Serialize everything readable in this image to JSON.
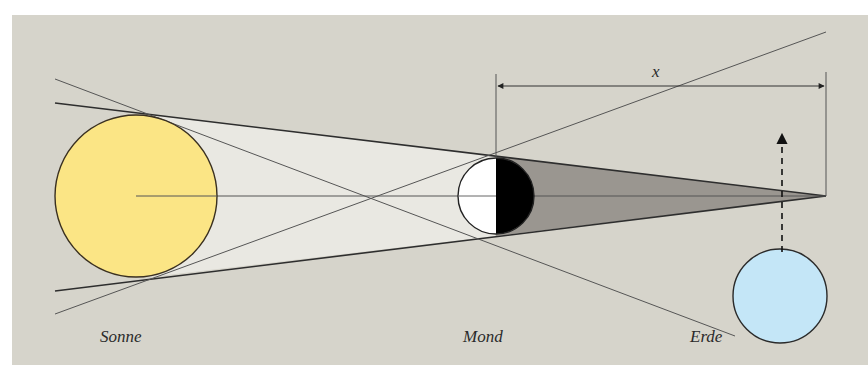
{
  "diagram": {
    "title": "",
    "colors": {
      "panel": "#d6d4cb",
      "page": "#ffffff",
      "sun": "#fbe585",
      "earth": "#c4e6f7",
      "penumbra": "#e9e8e2",
      "umbra": "#9a9690",
      "moon_lit": "#ffffff",
      "moon_dark": "#000000",
      "line": "#3a3a3a"
    },
    "bodies": [
      {
        "id": "sun",
        "label": "Sonne",
        "cx": 136,
        "cy": 196,
        "r": 81
      },
      {
        "id": "moon",
        "label": "Mond",
        "cx": 496,
        "cy": 196,
        "r": 38
      },
      {
        "id": "earth",
        "label": "Erde",
        "cx": 780,
        "cy": 296,
        "r": 47
      }
    ],
    "labels": {
      "sun": "Sonne",
      "moon": "Mond",
      "earth": "Erde",
      "distance": "x"
    },
    "dimension": {
      "label": "x",
      "x1": 496,
      "x2": 826,
      "y": 86
    },
    "umbra_apex": {
      "x": 826,
      "y": 196
    },
    "earth_motion_arrow": {
      "x": 782,
      "y_from": 252,
      "y_to": 130
    }
  }
}
